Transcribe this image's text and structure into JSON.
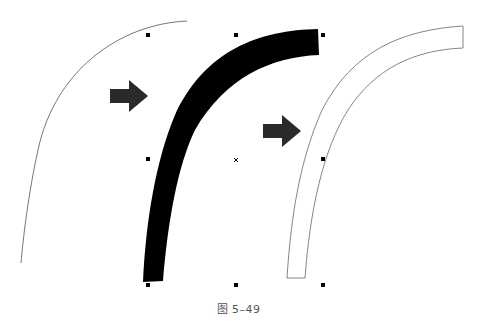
{
  "figure": {
    "caption": "图 5–49",
    "colors": {
      "background": "#ffffff",
      "thin_curve": "#666666",
      "filled_stroke": "#000000",
      "outline": "#777777",
      "arrow": "#2a2a2a",
      "handles": "#000000"
    },
    "panels": [
      {
        "name": "thin-curve",
        "label": "Original thin curve"
      },
      {
        "name": "thick-stroke",
        "label": "Thick filled stroke with selection handles"
      },
      {
        "name": "outlined-shape",
        "label": "Outlined stroke shape"
      }
    ],
    "arrows": [
      {
        "name": "arrow-1",
        "direction": "right"
      },
      {
        "name": "arrow-2",
        "direction": "right"
      }
    ],
    "selection": {
      "handles_count": 8,
      "center_marker": "×"
    }
  }
}
